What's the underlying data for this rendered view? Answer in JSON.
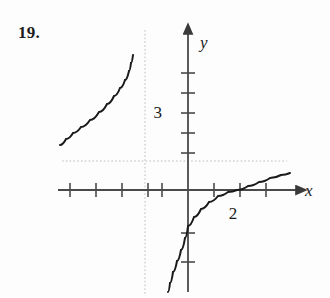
{
  "figure": {
    "exercise_number": "19.",
    "background_color": "#fdfdfd",
    "axis_color": "#4a4a4a",
    "curve_color": "#1a1a1a",
    "asymptote_color": "#bdbdbd"
  },
  "axes": {
    "x_axis_label": "x",
    "y_axis_label": "y",
    "x_axis_label_style": "italic",
    "y_axis_label_style": "italic",
    "origin_px": {
      "x": 188,
      "y": 190
    },
    "x_unit_px": 26,
    "y_unit_px": 20,
    "x_axis_start_px": 58,
    "x_axis_end_px": 300,
    "y_axis_top_px": 30,
    "y_axis_bottom_px": 292,
    "x_arrow": true,
    "y_arrow": true
  },
  "tick_labels": {
    "y_label_3": "3",
    "x_label_2": "2"
  },
  "chart_data": {
    "type": "line",
    "title": "",
    "subtitle": "",
    "xlabel": "x",
    "ylabel": "y",
    "grid": false,
    "legend": "none",
    "xlim": [
      -5.0,
      4.3
    ],
    "ylim": [
      -5.1,
      5.0
    ],
    "x_ticks": [
      -5,
      -4,
      -3,
      -2,
      -1,
      1,
      2,
      3
    ],
    "y_ticks": [
      -2,
      -1,
      1,
      2,
      3,
      4,
      5
    ],
    "labeled_x_ticks": [
      {
        "value": 2,
        "label": "2"
      }
    ],
    "labeled_y_ticks": [
      {
        "value": 3,
        "label": "3"
      }
    ],
    "annotations": [
      {
        "text": "19.",
        "role": "exercise-number",
        "x_px": 18,
        "y_px": 24
      },
      {
        "text": "2",
        "role": "x-tick-label",
        "x_px": 233,
        "y_px": 212
      },
      {
        "text": "3",
        "role": "y-tick-label",
        "x_px": 168,
        "y_px": 112
      },
      {
        "text": "x",
        "role": "axis-label",
        "x_px": 313,
        "y_px": 196
      },
      {
        "text": "y",
        "role": "axis-label",
        "x_px": 203,
        "y_px": 42
      }
    ],
    "asymptotes": [
      {
        "kind": "vertical",
        "value": -1.65,
        "x_px": 145,
        "style": "dotted",
        "color": "#bdbdbd"
      },
      {
        "kind": "horizontal",
        "value": 1.45,
        "y_px": 161,
        "style": "dotted",
        "color": "#bdbdbd"
      }
    ],
    "intercepts": {
      "x_intercept": 1.9,
      "y_intercept": -1.8
    },
    "series": [
      {
        "name": "left-branch",
        "description": "upper-left branch approaching vertical asymptote from the left, above the horizontal asymptote",
        "points_px": [
          [
            60,
            145
          ],
          [
            66,
            139
          ],
          [
            73,
            133
          ],
          [
            81,
            127
          ],
          [
            90,
            120
          ],
          [
            99,
            112
          ],
          [
            107,
            104
          ],
          [
            114,
            96
          ],
          [
            120,
            88
          ],
          [
            125,
            80
          ],
          [
            129,
            71
          ],
          [
            131,
            63
          ],
          [
            133,
            55
          ]
        ]
      },
      {
        "name": "right-branch",
        "description": "lower-right branch rising from below, crossing y-axis near -1.8 and x-axis near 1.9, flattening toward the horizontal asymptote",
        "points_px": [
          [
            168,
            292
          ],
          [
            170,
            283
          ],
          [
            173,
            272
          ],
          [
            177,
            261
          ],
          [
            181,
            250
          ],
          [
            185,
            238
          ],
          [
            188,
            226
          ],
          [
            194,
            217
          ],
          [
            201,
            209
          ],
          [
            209,
            202
          ],
          [
            218,
            196
          ],
          [
            228,
            192
          ],
          [
            237,
            190
          ],
          [
            248,
            186
          ],
          [
            259,
            182
          ],
          [
            270,
            178
          ],
          [
            281,
            175
          ],
          [
            290,
            173
          ]
        ]
      }
    ]
  }
}
